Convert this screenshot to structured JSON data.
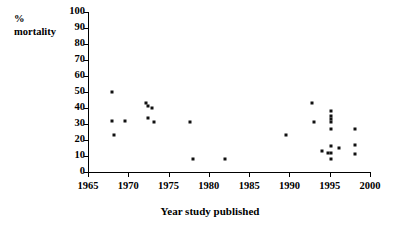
{
  "chart_data": {
    "type": "scatter",
    "title": "",
    "xlabel": "Year study published",
    "ylabel": "%\nmortality",
    "ylabel_lines": [
      "%",
      "mortality"
    ],
    "xlim": [
      1965,
      2000
    ],
    "ylim": [
      0,
      100
    ],
    "xticks": [
      1965,
      1970,
      1975,
      1980,
      1985,
      1990,
      1995,
      2000
    ],
    "xtick_labels": [
      "1965",
      "1970",
      "1975",
      "1980",
      "1985",
      "1990",
      "1995",
      "2000"
    ],
    "yticks": [
      0,
      10,
      20,
      30,
      40,
      50,
      60,
      70,
      80,
      90,
      100
    ],
    "ytick_labels": [
      "0",
      "10",
      "20",
      "30",
      "40",
      "50",
      "60",
      "70",
      "80",
      "90",
      "100"
    ],
    "grid": false,
    "legend": false,
    "marker": "square",
    "marker_color": "#111111",
    "points": [
      {
        "x": 1968.0,
        "y": 50
      },
      {
        "x": 1968.0,
        "y": 32
      },
      {
        "x": 1968.2,
        "y": 23
      },
      {
        "x": 1969.6,
        "y": 32
      },
      {
        "x": 1972.2,
        "y": 43
      },
      {
        "x": 1972.4,
        "y": 41
      },
      {
        "x": 1973.0,
        "y": 40
      },
      {
        "x": 1972.4,
        "y": 34
      },
      {
        "x": 1973.2,
        "y": 31
      },
      {
        "x": 1977.6,
        "y": 31
      },
      {
        "x": 1978.0,
        "y": 8
      },
      {
        "x": 1982.0,
        "y": 8
      },
      {
        "x": 1989.6,
        "y": 23
      },
      {
        "x": 1992.8,
        "y": 43
      },
      {
        "x": 1993.0,
        "y": 31
      },
      {
        "x": 1994.0,
        "y": 13
      },
      {
        "x": 1994.8,
        "y": 12
      },
      {
        "x": 1995.2,
        "y": 38
      },
      {
        "x": 1995.2,
        "y": 35
      },
      {
        "x": 1995.2,
        "y": 33
      },
      {
        "x": 1995.2,
        "y": 31
      },
      {
        "x": 1995.2,
        "y": 27
      },
      {
        "x": 1995.2,
        "y": 16
      },
      {
        "x": 1995.2,
        "y": 12
      },
      {
        "x": 1995.2,
        "y": 8
      },
      {
        "x": 1996.2,
        "y": 15
      },
      {
        "x": 1998.2,
        "y": 27
      },
      {
        "x": 1998.2,
        "y": 17
      },
      {
        "x": 1998.2,
        "y": 11
      }
    ]
  }
}
